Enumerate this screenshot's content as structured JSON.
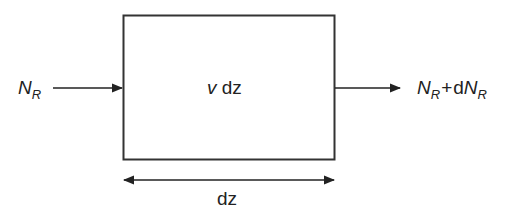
{
  "diagram": {
    "type": "control-volume flux balance",
    "box": {
      "label_var": "v",
      "label_rest": " dz"
    },
    "input": {
      "symbol": "N",
      "subscript": "R"
    },
    "output": {
      "symbol": "N",
      "subscript": "R",
      "operator": "+",
      "prefix": "d",
      "symbol2": "N",
      "subscript2": "R"
    },
    "width_label": "dz",
    "colors": {
      "stroke": "#222222",
      "background": "#ffffff"
    }
  }
}
